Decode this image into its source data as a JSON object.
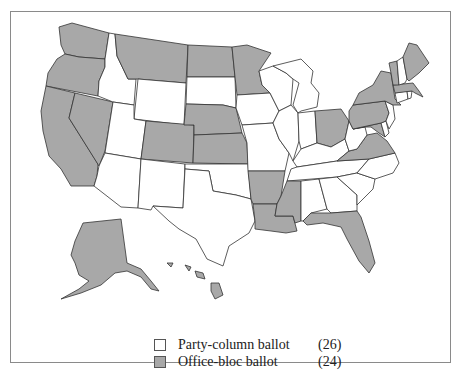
{
  "colors": {
    "party_column": "#ffffff",
    "office_bloc": "#a8a8a8",
    "border": "#333333"
  },
  "legend": [
    {
      "key": "party_column",
      "label": "Party-column ballot",
      "count": "(26)"
    },
    {
      "key": "office_bloc",
      "label": "Office-bloc ballot",
      "count": "(24)"
    }
  ],
  "states": {
    "WA": "office_bloc",
    "OR": "office_bloc",
    "CA": "office_bloc",
    "NV": "office_bloc",
    "ID": "party_column",
    "MT": "office_bloc",
    "WY": "party_column",
    "UT": "party_column",
    "AZ": "party_column",
    "CO": "office_bloc",
    "NM": "party_column",
    "ND": "office_bloc",
    "SD": "party_column",
    "NE": "office_bloc",
    "KS": "office_bloc",
    "OK": "party_column",
    "TX": "party_column",
    "MN": "office_bloc",
    "IA": "party_column",
    "MO": "party_column",
    "AR": "office_bloc",
    "LA": "office_bloc",
    "WI": "party_column",
    "IL": "party_column",
    "MI": "party_column",
    "IN": "party_column",
    "OH": "office_bloc",
    "KY": "party_column",
    "TN": "party_column",
    "MS": "office_bloc",
    "AL": "party_column",
    "GA": "party_column",
    "FL": "office_bloc",
    "SC": "party_column",
    "NC": "party_column",
    "VA": "office_bloc",
    "WV": "party_column",
    "MD": "office_bloc",
    "DE": "party_column",
    "PA": "office_bloc",
    "NJ": "party_column",
    "NY": "office_bloc",
    "CT": "party_column",
    "RI": "party_column",
    "MA": "office_bloc",
    "VT": "office_bloc",
    "NH": "party_column",
    "ME": "office_bloc",
    "AK": "office_bloc",
    "HI": "office_bloc"
  }
}
